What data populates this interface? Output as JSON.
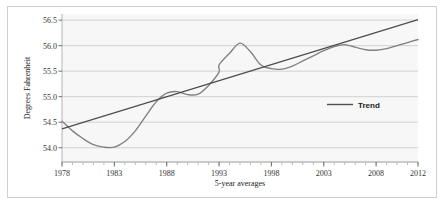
{
  "chart_data": {
    "type": "line",
    "title": "",
    "xlabel": "5-year averages",
    "ylabel": "Degrees Fahrenheit",
    "xlim": [
      1978,
      2012
    ],
    "ylim": [
      53.72,
      56.62
    ],
    "yticks": [
      "56.5",
      "56.0",
      "55.5",
      "55.0",
      "54.5",
      "54.0"
    ],
    "ytick_values": [
      56.5,
      56.0,
      55.5,
      55.0,
      54.5,
      54.0
    ],
    "xticks": [
      "1978",
      "1983",
      "1988",
      "1993",
      "1998",
      "2003",
      "2008",
      "2012"
    ],
    "xtick_values": [
      1978,
      1983,
      1988,
      1993,
      1998,
      2003,
      2008,
      2012
    ],
    "grid": true,
    "legend_position": "center-right",
    "legend": [
      {
        "name": "Trend",
        "color": "#4d4d4d",
        "style": "line"
      }
    ],
    "series": [
      {
        "name": "5-year average temperature",
        "color": "#808080",
        "x": [
          1978,
          1979,
          1980,
          1981,
          1982,
          1983,
          1984,
          1985,
          1986,
          1987,
          1988,
          1989,
          1990,
          1991,
          1992,
          1993,
          1994,
          1995,
          1996,
          1997,
          1998,
          1999,
          2000,
          2001,
          2002,
          2003,
          2004,
          2005,
          2006,
          2007,
          2008,
          2009,
          2010,
          2011,
          2012
        ],
        "values": [
          54.52,
          54.33,
          54.18,
          54.06,
          54.01,
          54.01,
          54.12,
          54.33,
          54.62,
          54.9,
          55.07,
          55.1,
          55.04,
          55.05,
          55.22,
          55.48,
          55.63,
          55.6,
          55.5,
          55.5,
          55.62,
          55.78,
          55.8,
          55.62,
          55.25,
          54.9,
          54.78,
          54.77,
          54.84,
          55.06,
          55.3,
          55.41,
          55.43,
          55.47,
          55.52
        ],
        "values_tail": [
          55.62,
          55.85,
          56.05,
          55.88,
          55.62,
          55.55,
          55.54,
          55.6,
          55.7,
          55.8,
          55.9,
          55.98,
          56.02,
          55.97,
          55.92,
          55.91,
          55.94,
          56.0,
          56.06,
          56.12
        ]
      },
      {
        "name": "Trend",
        "color": "#4d4d4d",
        "x": [
          1978,
          2012
        ],
        "values": [
          54.37,
          56.51
        ]
      }
    ]
  },
  "legend": {
    "trend_label": "Trend"
  },
  "axes": {
    "y_title": "Degrees Fahrenheit",
    "x_title": "5-year averages"
  }
}
